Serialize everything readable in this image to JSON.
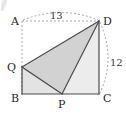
{
  "figure": {
    "vertices": [
      {
        "id": "A",
        "label": "A",
        "x": 22,
        "y": 21,
        "label_x": 11,
        "label_y": 25,
        "on_shape": false
      },
      {
        "id": "D",
        "label": "D",
        "x": 99,
        "y": 21,
        "label_x": 103,
        "label_y": 25,
        "on_shape": true
      },
      {
        "id": "B",
        "label": "B",
        "x": 22,
        "y": 94,
        "label_x": 11,
        "label_y": 102,
        "on_shape": true
      },
      {
        "id": "C",
        "label": "C",
        "x": 99,
        "y": 94,
        "label_x": 103,
        "label_y": 102,
        "on_shape": true
      },
      {
        "id": "Q",
        "label": "Q",
        "x": 22,
        "y": 67,
        "label_x": 8,
        "label_y": 71,
        "on_shape": true
      },
      {
        "id": "P",
        "label": "P",
        "x": 62,
        "y": 94,
        "label_x": 58,
        "label_y": 108,
        "on_shape": true
      }
    ],
    "measures": [
      {
        "id": "top-arc",
        "label": "13",
        "from": "A",
        "to": "D",
        "label_x": 56,
        "label_y": 19,
        "style": "dashed-arc"
      },
      {
        "id": "right-arc",
        "label": "12",
        "from": "D",
        "to": "C",
        "label_x": 112,
        "label_y": 62,
        "style": "dashed-arc"
      }
    ],
    "solid_edges": [
      {
        "id": "edge-B-C",
        "from": "B",
        "to": "C"
      },
      {
        "id": "edge-C-D",
        "from": "C",
        "to": "D"
      },
      {
        "id": "edge-Q-D",
        "from": "Q",
        "to": "D"
      },
      {
        "id": "edge-Q-P",
        "from": "Q",
        "to": "P"
      },
      {
        "id": "edge-P-D",
        "from": "P",
        "to": "D"
      },
      {
        "id": "edge-B-Q",
        "from": "B",
        "to": "Q"
      }
    ],
    "dashed_edges": [
      {
        "id": "edge-A-B",
        "from": "A",
        "to": "B"
      },
      {
        "id": "edge-A-D",
        "from": "A",
        "to": "D"
      }
    ],
    "shaded_regions": [
      {
        "id": "region-Q-D-P",
        "points": "22,67 99,21 62,94",
        "fill": "#d2d2d2"
      },
      {
        "id": "region-B-Q-P",
        "points": "22,67 62,94 22,94",
        "fill": "#e3e3e3"
      },
      {
        "id": "region-P-C-D",
        "points": "62,94 99,94 99,21",
        "fill": "#ececec"
      }
    ],
    "colors": {
      "background": "#ffffff",
      "stroke": "#4a4a4a",
      "dashed_stroke": "#a8a8a8",
      "label_text": "#1f1f1f",
      "measure_text": "#3a3a3a",
      "fill_dark": "#d2d2d2",
      "fill_mid": "#e3e3e3",
      "fill_light": "#ececec"
    }
  }
}
